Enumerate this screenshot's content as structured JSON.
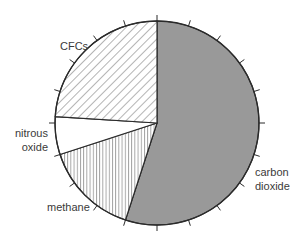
{
  "chart_data": {
    "type": "pie",
    "title": "",
    "unit": "%",
    "start_angle_deg": 0,
    "direction": "clockwise",
    "tick_interval_pct": 5,
    "slices": [
      {
        "label": "carbon dioxide",
        "label_lines": [
          "carbon",
          "dioxide"
        ],
        "value": 55,
        "fill": "#999999",
        "pattern": "solid"
      },
      {
        "label": "methane",
        "label_lines": [
          "methane"
        ],
        "value": 15,
        "fill": "#ffffff",
        "pattern": "vertical-lines"
      },
      {
        "label": "nitrous oxide",
        "label_lines": [
          "nitrous",
          "oxide"
        ],
        "value": 6,
        "fill": "#ffffff",
        "pattern": "none"
      },
      {
        "label": "CFCs",
        "label_lines": [
          "CFCs"
        ],
        "value": 24,
        "fill": "#ffffff",
        "pattern": "diagonal-lines"
      }
    ]
  },
  "labels": {
    "carbon_dioxide_line1": "carbon",
    "carbon_dioxide_line2": "dioxide",
    "methane": "methane",
    "nitrous_oxide_line1": "nitrous",
    "nitrous_oxide_line2": "oxide",
    "cfcs": "CFCs"
  },
  "colors": {
    "outline": "#2b2b2b",
    "co2_fill": "#999999",
    "hatch": "#444444",
    "text": "#3a3a3a"
  }
}
